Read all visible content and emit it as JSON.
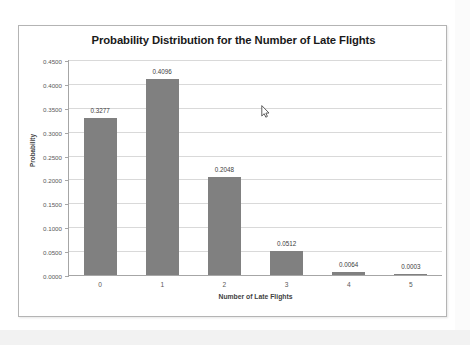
{
  "chart_data": {
    "type": "bar",
    "title": "Probability Distribution for the Number of Late Flights",
    "xlabel": "Number of Late Flights",
    "ylabel": "Probability",
    "categories": [
      "0",
      "1",
      "2",
      "3",
      "4",
      "5"
    ],
    "values": [
      0.3277,
      0.4096,
      0.2048,
      0.0512,
      0.0064,
      0.0003
    ],
    "data_labels": [
      "0.3277",
      "0.4096",
      "0.2048",
      "0.0512",
      "0.0064",
      "0.0003"
    ],
    "ylim": [
      0.0,
      0.45
    ],
    "ytick_step": 0.05,
    "ytick_labels": [
      "0.4500",
      "0.4000",
      "0.3500",
      "0.3000",
      "0.2500",
      "0.2000",
      "0.1500",
      "0.1000",
      "0.0500",
      "0.0000"
    ],
    "ytick_values": [
      0.45,
      0.4,
      0.35,
      0.3,
      0.25,
      0.2,
      0.15,
      0.1,
      0.05,
      0.0
    ],
    "grid": true,
    "legend": false,
    "legend_position": "none",
    "bar_color": "#808080",
    "gridline_color": "#d9d9d9",
    "axis_color": "#a6a6a6",
    "plot_background": "#ffffff"
  },
  "cursor": {
    "name": "mouse-pointer",
    "x": 260,
    "y": 104
  }
}
